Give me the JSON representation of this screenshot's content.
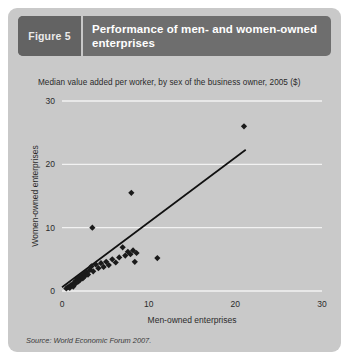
{
  "figure": {
    "number_label": "Figure 5",
    "title": "Performance of men- and women-owned enterprises",
    "source": "Source: World Economic Forum 2007."
  },
  "colors": {
    "card_background": "#c9c9c9",
    "header_bar": "#6e6e6e",
    "figure_tag": "#636363",
    "title_text": "#ffffff",
    "gridline": "#f2f2f2",
    "marker": "#1a1a1a",
    "trendline": "#111111"
  },
  "chart_data": {
    "type": "scatter",
    "title": "Median value added per worker, by sex of the business owner, 2005 ($)",
    "xlabel": "Men-owned enterprises",
    "ylabel": "Women-owned enterprises",
    "xlim": [
      0,
      30
    ],
    "ylim": [
      0,
      30
    ],
    "xticks": [
      0,
      10,
      20,
      30
    ],
    "yticks": [
      0,
      10,
      20,
      30
    ],
    "xtick_labels": [
      "0",
      "10",
      "20",
      "30"
    ],
    "ytick_labels": [
      "0",
      "10",
      "20",
      "30"
    ],
    "grid": "horizontal",
    "legend": "none",
    "points": [
      [
        0.5,
        0.4
      ],
      [
        0.7,
        0.6
      ],
      [
        0.9,
        0.5
      ],
      [
        1.0,
        0.9
      ],
      [
        1.2,
        1.0
      ],
      [
        1.3,
        0.7
      ],
      [
        1.4,
        1.3
      ],
      [
        1.5,
        1.1
      ],
      [
        1.6,
        1.6
      ],
      [
        1.7,
        1.4
      ],
      [
        1.8,
        1.9
      ],
      [
        1.9,
        1.5
      ],
      [
        2.0,
        2.1
      ],
      [
        2.1,
        1.8
      ],
      [
        2.2,
        2.4
      ],
      [
        2.4,
        2.0
      ],
      [
        2.5,
        2.7
      ],
      [
        2.6,
        2.3
      ],
      [
        2.8,
        3.0
      ],
      [
        3.0,
        2.6
      ],
      [
        3.2,
        3.3
      ],
      [
        3.4,
        3.9
      ],
      [
        3.6,
        3.1
      ],
      [
        3.9,
        4.2
      ],
      [
        4.2,
        3.6
      ],
      [
        4.5,
        4.4
      ],
      [
        4.8,
        3.8
      ],
      [
        5.1,
        4.6
      ],
      [
        5.4,
        4.1
      ],
      [
        5.8,
        5.0
      ],
      [
        6.2,
        4.5
      ],
      [
        6.6,
        5.3
      ],
      [
        7.0,
        6.9
      ],
      [
        7.3,
        5.6
      ],
      [
        7.6,
        6.2
      ],
      [
        7.9,
        5.8
      ],
      [
        8.2,
        6.4
      ],
      [
        8.4,
        4.6
      ],
      [
        8.6,
        6.0
      ],
      [
        3.5,
        10.0
      ],
      [
        8.0,
        15.5
      ],
      [
        11.0,
        5.2
      ],
      [
        21.0,
        26.0
      ]
    ],
    "trendline": {
      "x0": 0.0,
      "y0": 0.6,
      "x1": 21.2,
      "y1": 22.3
    }
  }
}
